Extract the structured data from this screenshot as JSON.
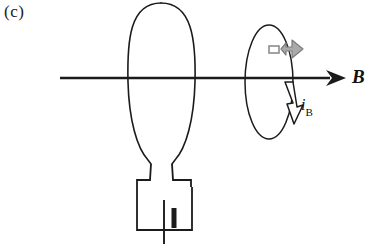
{
  "figure": {
    "panel_label": "(c)",
    "field_label": "B",
    "current_symbol": "i",
    "current_subscript": "B",
    "width": 377,
    "height": 244,
    "background_color": "#ffffff",
    "ink_color": "#1b1b1b",
    "accent_gray": "#8d8d8d"
  },
  "elements": {
    "field_axis": {
      "name": "magnetic-field-axis",
      "x_start": 60,
      "x_end": 345,
      "y": 78,
      "arrow_direction": "right"
    },
    "large_coil": {
      "name": "large-current-loop",
      "center_x": 161,
      "center_y": 79,
      "radius_x": 34,
      "radius_y": 76
    },
    "small_coil": {
      "name": "small-current-loop",
      "center_x": 269,
      "center_y": 82,
      "radius_x": 24,
      "radius_y": 57
    },
    "battery": {
      "name": "battery-source",
      "box_left": 136,
      "box_top": 186,
      "box_right": 192,
      "box_bottom": 230,
      "long_terminal_label": "positive",
      "short_terminal_label": "negative"
    },
    "dipole_arrow": {
      "name": "magnetic-moment-arrow",
      "color": "#8d8d8d",
      "direction": "right",
      "x": 282,
      "y": 52
    },
    "current_arrow": {
      "name": "induced-current-arrow",
      "fill": "#ffffff",
      "direction": "down",
      "x": 292,
      "y": 100
    }
  }
}
